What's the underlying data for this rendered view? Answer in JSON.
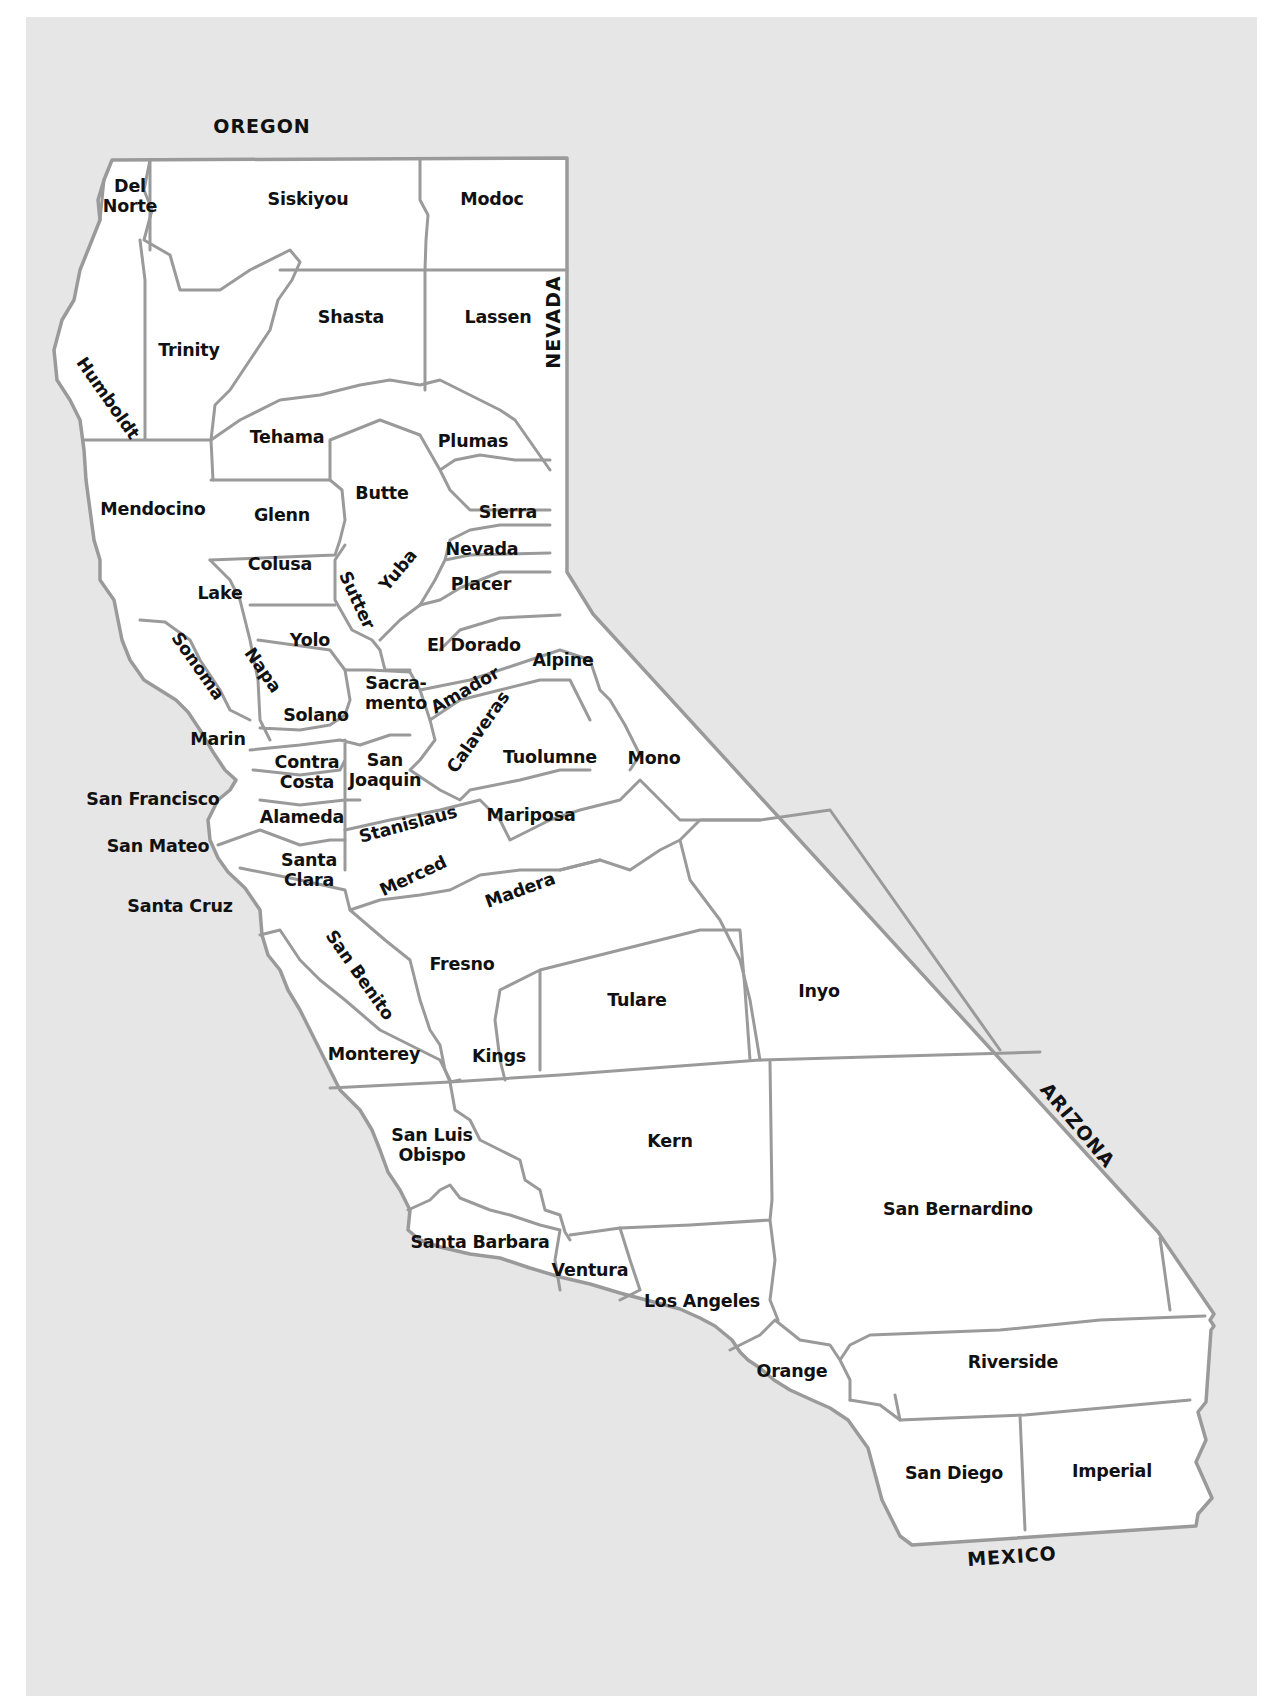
{
  "map": {
    "title": "California Counties",
    "colors": {
      "background": "#e6e6e6",
      "land": "#ffffff",
      "border": "#9a9a9a",
      "text": "#111111"
    },
    "neighbors": [
      {
        "name": "OREGON",
        "x": 262,
        "y": 126,
        "rotate": 0
      },
      {
        "name": "NEVADA",
        "x": 553,
        "y": 322,
        "rotate": -90
      },
      {
        "name": "ARIZONA",
        "x": 1078,
        "y": 1125,
        "rotate": 50
      },
      {
        "name": "MEXICO",
        "x": 1012,
        "y": 1556,
        "rotate": -4
      }
    ],
    "counties": [
      {
        "name": "Del\nNorte",
        "x": 130,
        "y": 196,
        "rotate": 0
      },
      {
        "name": "Siskiyou",
        "x": 308,
        "y": 199,
        "rotate": 0
      },
      {
        "name": "Modoc",
        "x": 492,
        "y": 199,
        "rotate": 0
      },
      {
        "name": "Humboldt",
        "x": 108,
        "y": 398,
        "rotate": 55
      },
      {
        "name": "Trinity",
        "x": 189,
        "y": 350,
        "rotate": 0
      },
      {
        "name": "Shasta",
        "x": 351,
        "y": 317,
        "rotate": 0
      },
      {
        "name": "Lassen",
        "x": 498,
        "y": 317,
        "rotate": 0
      },
      {
        "name": "Tehama",
        "x": 287,
        "y": 437,
        "rotate": 0
      },
      {
        "name": "Plumas",
        "x": 473,
        "y": 441,
        "rotate": 0
      },
      {
        "name": "Mendocino",
        "x": 153,
        "y": 509,
        "rotate": 0
      },
      {
        "name": "Butte",
        "x": 382,
        "y": 493,
        "rotate": 0
      },
      {
        "name": "Glenn",
        "x": 282,
        "y": 515,
        "rotate": 0
      },
      {
        "name": "Sierra",
        "x": 508,
        "y": 512,
        "rotate": 0
      },
      {
        "name": "Nevada",
        "x": 482,
        "y": 549,
        "rotate": 0
      },
      {
        "name": "Colusa",
        "x": 280,
        "y": 564,
        "rotate": 0
      },
      {
        "name": "Yuba",
        "x": 398,
        "y": 570,
        "rotate": -50
      },
      {
        "name": "Sutter",
        "x": 357,
        "y": 600,
        "rotate": 65
      },
      {
        "name": "Placer",
        "x": 481,
        "y": 584,
        "rotate": 0
      },
      {
        "name": "Lake",
        "x": 220,
        "y": 593,
        "rotate": 0
      },
      {
        "name": "Yolo",
        "x": 310,
        "y": 640,
        "rotate": 0
      },
      {
        "name": "El Dorado",
        "x": 474,
        "y": 645,
        "rotate": 0
      },
      {
        "name": "Sonoma",
        "x": 198,
        "y": 666,
        "rotate": 55
      },
      {
        "name": "Napa",
        "x": 263,
        "y": 670,
        "rotate": 55
      },
      {
        "name": "Alpine",
        "x": 563,
        "y": 660,
        "rotate": 0
      },
      {
        "name": "Sacra-\nmento",
        "x": 396,
        "y": 693,
        "rotate": 0
      },
      {
        "name": "Amador",
        "x": 465,
        "y": 690,
        "rotate": -30
      },
      {
        "name": "Solano",
        "x": 316,
        "y": 715,
        "rotate": 0
      },
      {
        "name": "Calaveras",
        "x": 478,
        "y": 732,
        "rotate": -55
      },
      {
        "name": "Marin",
        "x": 218,
        "y": 739,
        "rotate": 0
      },
      {
        "name": "Mono",
        "x": 654,
        "y": 758,
        "rotate": 0
      },
      {
        "name": "Tuolumne",
        "x": 550,
        "y": 757,
        "rotate": 0
      },
      {
        "name": "Contra\nCosta",
        "x": 307,
        "y": 772,
        "rotate": 0
      },
      {
        "name": "San\nJoaquin",
        "x": 385,
        "y": 770,
        "rotate": 0
      },
      {
        "name": "San Francisco",
        "x": 153,
        "y": 799,
        "rotate": 0
      },
      {
        "name": "Alameda",
        "x": 302,
        "y": 817,
        "rotate": 0
      },
      {
        "name": "Mariposa",
        "x": 531,
        "y": 815,
        "rotate": 0
      },
      {
        "name": "Stanislaus",
        "x": 408,
        "y": 824,
        "rotate": -15
      },
      {
        "name": "San Mateo",
        "x": 158,
        "y": 846,
        "rotate": 0
      },
      {
        "name": "Santa\nClara",
        "x": 309,
        "y": 870,
        "rotate": 0
      },
      {
        "name": "Merced",
        "x": 413,
        "y": 876,
        "rotate": -25
      },
      {
        "name": "Madera",
        "x": 520,
        "y": 890,
        "rotate": -20
      },
      {
        "name": "Santa Cruz",
        "x": 180,
        "y": 906,
        "rotate": 0
      },
      {
        "name": "Fresno",
        "x": 462,
        "y": 964,
        "rotate": 0
      },
      {
        "name": "San Benito",
        "x": 360,
        "y": 975,
        "rotate": 55
      },
      {
        "name": "Tulare",
        "x": 637,
        "y": 1000,
        "rotate": 0
      },
      {
        "name": "Inyo",
        "x": 819,
        "y": 991,
        "rotate": 0
      },
      {
        "name": "Monterey",
        "x": 374,
        "y": 1054,
        "rotate": 0
      },
      {
        "name": "Kings",
        "x": 499,
        "y": 1056,
        "rotate": 0
      },
      {
        "name": "Kern",
        "x": 670,
        "y": 1141,
        "rotate": 0
      },
      {
        "name": "San Luis\nObispo",
        "x": 432,
        "y": 1145,
        "rotate": 0
      },
      {
        "name": "San Bernardino",
        "x": 958,
        "y": 1209,
        "rotate": 0
      },
      {
        "name": "Santa Barbara",
        "x": 480,
        "y": 1242,
        "rotate": 0
      },
      {
        "name": "Ventura",
        "x": 590,
        "y": 1270,
        "rotate": 0
      },
      {
        "name": "Los Angeles",
        "x": 702,
        "y": 1301,
        "rotate": 0
      },
      {
        "name": "Riverside",
        "x": 1013,
        "y": 1362,
        "rotate": 0
      },
      {
        "name": "Orange",
        "x": 792,
        "y": 1371,
        "rotate": 0
      },
      {
        "name": "San Diego",
        "x": 954,
        "y": 1473,
        "rotate": 0
      },
      {
        "name": "Imperial",
        "x": 1112,
        "y": 1471,
        "rotate": 0
      }
    ]
  }
}
